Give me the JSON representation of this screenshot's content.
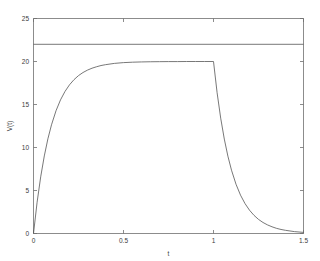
{
  "figure": {
    "background_color": "#ffffff",
    "axis_color": "#6e6e6e",
    "line_color": "#555555"
  },
  "chart_data": {
    "type": "line",
    "title": "",
    "subtitle": "",
    "xlabel": "t",
    "ylabel": "V(t)",
    "xlim": [
      0,
      1.5
    ],
    "ylim": [
      0,
      25
    ],
    "xticks": [
      0,
      0.5,
      1,
      1.5
    ],
    "xticklabels": [
      "0",
      "0.5",
      "1",
      "1.5"
    ],
    "yticks": [
      0,
      5,
      10,
      15,
      20,
      25
    ],
    "yticklabels": [
      "0",
      "5",
      "10",
      "15",
      "20",
      "25"
    ],
    "grid": false,
    "legend": null,
    "legend_position": "none",
    "annotations": [],
    "series": [
      {
        "name": "supply-reference",
        "description": "constant horizontal reference line",
        "style": "solid",
        "color": "#555555",
        "x": [
          0,
          1.5
        ],
        "values": [
          22,
          22
        ]
      },
      {
        "name": "V(t)",
        "description": "RC charge to 20 V then discharge after t = 1",
        "style": "solid",
        "color": "#555555",
        "plateau_value": 20,
        "switch_time": 1,
        "charge_tau": 0.1,
        "discharge_tau": 0.1,
        "x": [
          0,
          0.02,
          0.04,
          0.06,
          0.08,
          0.1,
          0.125,
          0.15,
          0.175,
          0.2,
          0.225,
          0.25,
          0.275,
          0.3,
          0.325,
          0.35,
          0.375,
          0.4,
          0.45,
          0.5,
          0.55,
          0.6,
          0.65,
          0.7,
          0.75,
          0.8,
          0.85,
          0.9,
          0.95,
          1,
          1.02,
          1.04,
          1.06,
          1.08,
          1.1,
          1.125,
          1.15,
          1.175,
          1.2,
          1.225,
          1.25,
          1.275,
          1.3,
          1.325,
          1.35,
          1.375,
          1.4,
          1.45,
          1.5
        ],
        "values": [
          0,
          3.63,
          6.59,
          9.02,
          11.01,
          12.64,
          14.27,
          15.54,
          16.52,
          17.29,
          17.89,
          18.36,
          18.72,
          19.0,
          19.22,
          19.39,
          19.53,
          19.63,
          19.78,
          19.87,
          19.92,
          19.95,
          19.97,
          19.98,
          19.99,
          19.99,
          20.0,
          20.0,
          20.0,
          20.0,
          16.37,
          13.41,
          10.98,
          8.99,
          7.36,
          5.73,
          4.46,
          3.48,
          2.71,
          2.11,
          1.64,
          1.28,
          1.0,
          0.78,
          0.6,
          0.47,
          0.37,
          0.22,
          0.13
        ]
      }
    ]
  }
}
